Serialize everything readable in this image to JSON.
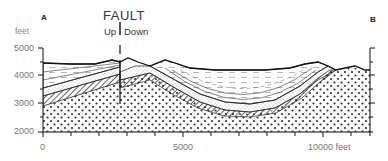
{
  "diagram": {
    "type": "geologic-cross-section",
    "endpoints": {
      "left": "A",
      "right": "B"
    },
    "y_axis": {
      "unit_label": "feet",
      "ticks": [
        "5000",
        "4000",
        "3000",
        "2000"
      ],
      "values": [
        5000,
        4000,
        3000,
        2000
      ],
      "range": [
        2000,
        5500
      ]
    },
    "x_axis": {
      "ticks": [
        "0",
        "5000",
        "10000 feet"
      ],
      "values": [
        0,
        5000,
        10000
      ],
      "range": [
        0,
        11700
      ]
    },
    "fault": {
      "title": "FAULT",
      "up_label": "Up",
      "down_label": "Down",
      "x_position_feet": 2700
    },
    "structures": [
      "Faulted layered strata on left (up side)",
      "Syncline (folded basin) in center-right",
      "Basement conglomerate / dotted layer beneath"
    ],
    "colors": {
      "line": "#222222",
      "text": "#555555",
      "background": "#ffffff"
    }
  }
}
